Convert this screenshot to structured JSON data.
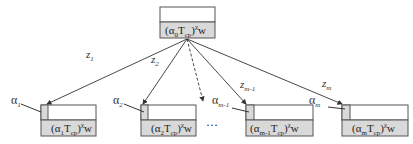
{
  "root": {
    "label_prefix": "(α",
    "label_sub": "0",
    "label_mid": "T",
    "label_mid_sub": "cp",
    "label_close": ")",
    "label_sup": "χ",
    "label_suffix": "w"
  },
  "children": [
    {
      "edge_label": "z",
      "edge_sub": "1",
      "alpha": "α",
      "alpha_sub": "1",
      "label_sub": "1"
    },
    {
      "edge_label": "z",
      "edge_sub": "2",
      "alpha": "α",
      "alpha_sub": "2",
      "label_sub": "2"
    },
    {
      "edge_label": "z",
      "edge_sub": "m-1",
      "alpha": "α",
      "alpha_sub": "m-1",
      "label_sub": "m-1"
    },
    {
      "edge_label": "z",
      "edge_sub": "m",
      "alpha": "α",
      "alpha_sub": "m",
      "label_sub": "m"
    }
  ],
  "ellipsis": "···",
  "colors": {
    "box_fill_bottom": "#d9d9d9",
    "box_fill_top": "#ffffff",
    "small_cell": "#d9d9d9",
    "stroke": "#555555"
  }
}
